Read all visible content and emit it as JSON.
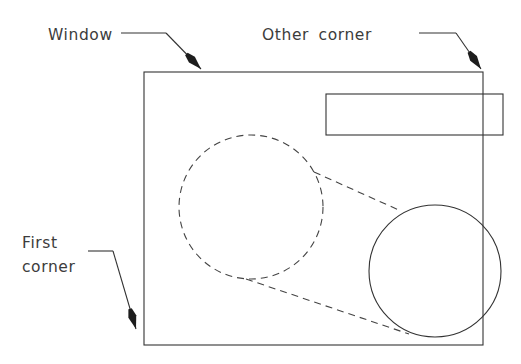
{
  "diagram": {
    "type": "cad-window-selection-diagram",
    "background_color": "#ffffff",
    "stroke_color": "#333333",
    "text_color": "#3c3c3c",
    "labels": {
      "window": "Window",
      "other_corner": "Other  corner",
      "first_corner_line1": "First",
      "first_corner_line2": "corner"
    },
    "shapes": {
      "window_rect": {
        "name": "window-selection-rectangle",
        "style": "solid",
        "x": 144,
        "y": 72,
        "width": 339,
        "height": 273
      },
      "inner_rect": {
        "name": "inner-rectangle-entity",
        "style": "solid",
        "x": 326,
        "y": 94,
        "width": 177,
        "height": 41
      },
      "dashed_circle": {
        "name": "dashed-circle-entity",
        "style": "dashed",
        "cx": 251,
        "cy": 207,
        "r": 72
      },
      "solid_circle": {
        "name": "solid-circle-entity",
        "style": "solid",
        "cx": 435,
        "cy": 271,
        "r": 66
      },
      "tangent_upper": {
        "name": "dashed-tangent-line-upper",
        "style": "dashed",
        "x1": 314,
        "y1": 172,
        "x2": 401,
        "y2": 211
      },
      "tangent_lower": {
        "name": "dashed-tangent-line-lower",
        "style": "dashed",
        "x1": 246,
        "y1": 279,
        "x2": 409,
        "y2": 334
      }
    },
    "leaders": {
      "window": {
        "name": "window-leader-line",
        "text_x": 48,
        "text_y": 40,
        "horizontal": {
          "x1": 121,
          "y1": 33,
          "x2": 166,
          "y2": 33
        },
        "diagonal": {
          "x1": 166,
          "y1": 33,
          "x2": 201,
          "y2": 69
        },
        "arrow_tip": {
          "x": 201,
          "y": 69
        }
      },
      "other_corner": {
        "name": "other-corner-leader-line",
        "text_x": 262,
        "text_y": 40,
        "horizontal": {
          "x1": 419,
          "y1": 33,
          "x2": 456,
          "y2": 33
        },
        "diagonal": {
          "x1": 456,
          "y1": 33,
          "x2": 481,
          "y2": 69
        },
        "arrow_tip": {
          "x": 481,
          "y": 69
        }
      },
      "first_corner": {
        "name": "first-corner-leader-line",
        "text_x": 22,
        "text_y": 248,
        "text_y2": 272,
        "horizontal": {
          "x1": 88,
          "y1": 251,
          "x2": 113,
          "y2": 251
        },
        "diagonal": {
          "x1": 113,
          "y1": 251,
          "x2": 136,
          "y2": 329
        },
        "arrow_tip": {
          "x": 136,
          "y": 329
        }
      }
    }
  }
}
